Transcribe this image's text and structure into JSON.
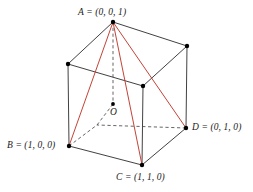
{
  "figure": {
    "width": 253,
    "height": 192,
    "background_color": "#ffffff"
  },
  "colors": {
    "edge_solid": "#2b2b2b",
    "edge_hidden": "#4a4a4a",
    "tetrahedron": "#c0392b",
    "vertex_dot": "#000000",
    "label_text": "#1a1a1a"
  },
  "labels": {
    "A": "A = (0, 0, 1)",
    "B": "B = (1, 0, 0)",
    "C": "C = (1, 1, 0)",
    "D": "D = (0, 1, 0)",
    "O": "O"
  },
  "vertices": [
    {
      "id": "A",
      "label": "A = (0, 0, 1)",
      "x": 113,
      "y": 22,
      "visible": true
    },
    {
      "id": "B",
      "label": "B = (1, 0, 0)",
      "x": 69,
      "y": 146,
      "visible": true
    },
    {
      "id": "C",
      "label": "C = (1, 1, 0)",
      "x": 142,
      "y": 165,
      "visible": true
    },
    {
      "id": "D",
      "label": "D = (0, 1, 0)",
      "x": 186,
      "y": 128,
      "visible": true
    },
    {
      "id": "O",
      "label": "O",
      "x": 113,
      "y": 104,
      "visible": true
    },
    {
      "id": "TL",
      "label": "",
      "x": 68,
      "y": 64,
      "visible": true
    },
    {
      "id": "TR",
      "label": "",
      "x": 187,
      "y": 46,
      "visible": true
    },
    {
      "id": "MB",
      "label": "",
      "x": 143,
      "y": 86,
      "visible": true
    },
    {
      "id": "HID",
      "label": "",
      "x": 97,
      "y": 125,
      "visible": false
    }
  ],
  "edges": {
    "solid": [
      {
        "from": "A",
        "to": "TL"
      },
      {
        "from": "A",
        "to": "TR"
      },
      {
        "from": "TL",
        "to": "MB"
      },
      {
        "from": "TR",
        "to": "MB"
      },
      {
        "from": "TL",
        "to": "B"
      },
      {
        "from": "TR",
        "to": "D"
      },
      {
        "from": "MB",
        "to": "C"
      },
      {
        "from": "B",
        "to": "C"
      },
      {
        "from": "C",
        "to": "D"
      }
    ],
    "hidden": [
      {
        "from": "A",
        "to": "O"
      },
      {
        "from": "O",
        "to": "HID"
      },
      {
        "from": "B",
        "to": "HID"
      },
      {
        "from": "D",
        "to": "HID"
      }
    ],
    "tetrahedron": [
      {
        "from": "A",
        "to": "B"
      },
      {
        "from": "A",
        "to": "C"
      },
      {
        "from": "A",
        "to": "D"
      },
      {
        "from": "B",
        "to": "D"
      },
      {
        "from": "B",
        "to": "C"
      },
      {
        "from": "C",
        "to": "D"
      }
    ]
  }
}
